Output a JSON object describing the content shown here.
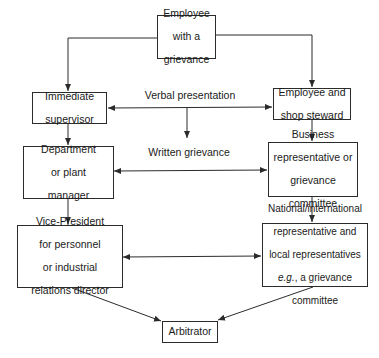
{
  "diagram": {
    "nodes": {
      "employee": {
        "lines": [
          "Employee",
          "with a",
          "grievance"
        ]
      },
      "supervisor": {
        "lines": [
          "Immediate",
          "supervisor"
        ]
      },
      "steward": {
        "lines": [
          "Employee and",
          "shop steward"
        ]
      },
      "department": {
        "lines": [
          "Department",
          "or plant",
          "manager"
        ]
      },
      "business": {
        "lines": [
          "Business",
          "representative or",
          "grievance",
          "committee"
        ]
      },
      "vice_president": {
        "lines": [
          "Vice-President",
          "for personnel",
          "or industrial",
          "relations director"
        ]
      },
      "national": {
        "lines": [
          "National/international",
          "representative and",
          "local representatives",
          "e.g., a grievance",
          "committee"
        ],
        "italic_prefix_line": 3,
        "italic_prefix": "e.g."
      },
      "arbitrator": {
        "lines": [
          "Arbitrator"
        ]
      }
    },
    "labels": {
      "verbal": "Verbal presentation",
      "written": "Written grievance"
    },
    "edges": [
      {
        "from": "employee",
        "to": "supervisor",
        "type": "arrow"
      },
      {
        "from": "employee",
        "to": "steward",
        "type": "arrow"
      },
      {
        "from": "supervisor",
        "to": "steward",
        "type": "bidirectional",
        "label": "verbal"
      },
      {
        "from": "verbal-line",
        "to": "written-label",
        "type": "arrow"
      },
      {
        "from": "supervisor",
        "to": "department",
        "type": "arrow"
      },
      {
        "from": "steward",
        "to": "business",
        "type": "arrow"
      },
      {
        "from": "department",
        "to": "business",
        "type": "bidirectional"
      },
      {
        "from": "department",
        "to": "vice_president",
        "type": "arrow"
      },
      {
        "from": "business",
        "to": "national",
        "type": "arrow"
      },
      {
        "from": "vice_president",
        "to": "national",
        "type": "bidirectional"
      },
      {
        "from": "vice_president",
        "to": "arbitrator",
        "type": "arrow"
      },
      {
        "from": "national",
        "to": "arbitrator",
        "type": "arrow"
      }
    ],
    "colors": {
      "stroke": "#2b2b2b",
      "text": "#1a1a1a",
      "background": "#ffffff"
    }
  }
}
